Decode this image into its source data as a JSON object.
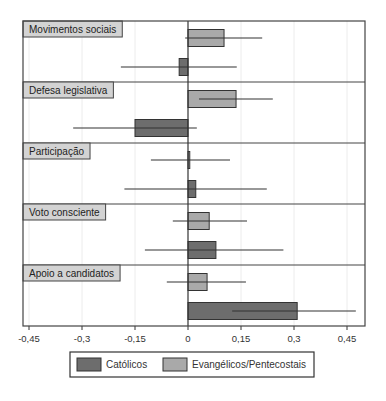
{
  "chart_data": {
    "type": "bar",
    "orientation": "horizontal",
    "title": "",
    "xlabel": "",
    "ylabel": "",
    "xlim": [
      -0.45,
      0.5
    ],
    "x_ticks": [
      -0.45,
      -0.3,
      -0.15,
      0,
      0.15,
      0.3,
      0.45
    ],
    "x_tick_labels": [
      "-0,45",
      "-0,3",
      "-0,15",
      "0",
      "0,15",
      "0,3",
      "0,45"
    ],
    "grid": true,
    "legend_position": "bottom",
    "categories": [
      "Movimentos sociais",
      "Defesa legislativa",
      "Participação",
      "Voto consciente",
      "Apoio a candidatos"
    ],
    "series": [
      {
        "name": "Evangélicos/Pentecostais",
        "color": "#a9a9a9",
        "values": [
          0.102,
          0.136,
          0.005,
          0.06,
          0.054
        ],
        "ci_low": [
          -0.008,
          0.031,
          -0.105,
          -0.043,
          -0.06
        ],
        "ci_high": [
          0.21,
          0.24,
          0.119,
          0.167,
          0.164
        ]
      },
      {
        "name": "Católicos",
        "color": "#6d6d6d",
        "values": [
          -0.025,
          -0.15,
          0.022,
          0.079,
          0.309
        ],
        "ci_low": [
          -0.19,
          -0.325,
          -0.18,
          -0.122,
          0.125
        ],
        "ci_high": [
          0.138,
          0.025,
          0.223,
          0.27,
          0.475
        ]
      }
    ],
    "legend": [
      "Católicos",
      "Evangélicos/Pentecostais"
    ],
    "label_box_color": "#d3d3d3"
  }
}
